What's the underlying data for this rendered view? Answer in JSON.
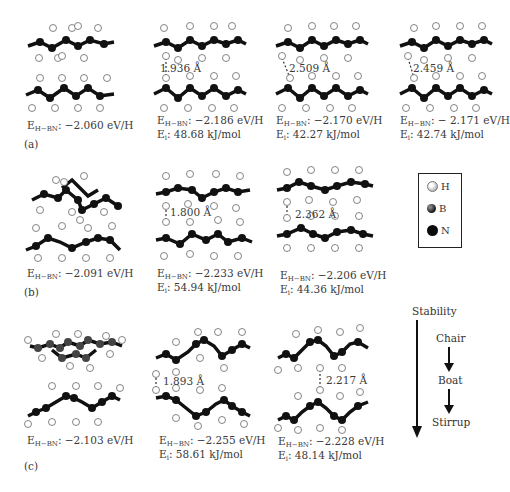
{
  "figure": {
    "rows": [
      {
        "label": "(a)",
        "panels": [
          {
            "energy_prefix": "E",
            "energy_sub": "H−BN",
            "energy_value": ": −2.060 eV/H",
            "ei_text": null,
            "distance": null
          },
          {
            "energy_prefix": "E",
            "energy_sub": "H−BN",
            "energy_value": ": −2.186 eV/H",
            "ei_prefix": "E",
            "ei_sub": "i",
            "ei_value": ": 48.68 kJ/mol",
            "distance": "1.936 Å"
          },
          {
            "energy_prefix": "E",
            "energy_sub": "H−BN",
            "energy_value": ": −2.170 eV/H",
            "ei_prefix": "E",
            "ei_sub": "i",
            "ei_value": ": 42.27 kJ/mol",
            "distance": "2.509 Å"
          },
          {
            "energy_prefix": "E",
            "energy_sub": "H−BN",
            "energy_value": ": − 2.171 eV/H",
            "ei_prefix": "E",
            "ei_sub": "i",
            "ei_value": ": 42.74 kJ/mol",
            "distance": "2.459 Å"
          }
        ]
      },
      {
        "label": "(b)",
        "panels": [
          {
            "energy_prefix": "E",
            "energy_sub": "H−BN",
            "energy_value": ": −2.091 eV/H",
            "distance": null
          },
          {
            "energy_prefix": "E",
            "energy_sub": "H−BN",
            "energy_value": ": −2.233 eV/H",
            "ei_prefix": "E",
            "ei_sub": "i",
            "ei_value": ": 54.94 kJ/mol",
            "distance": "1.800 Å"
          },
          {
            "energy_prefix": "E",
            "energy_sub": "H−BN",
            "energy_value": ": −2.206 eV/H",
            "ei_prefix": "E",
            "ei_sub": "i",
            "ei_value": ": 44.36 kJ/mol",
            "distance": "2.362 Å"
          }
        ]
      },
      {
        "label": "(c)",
        "panels": [
          {
            "energy_prefix": "E",
            "energy_sub": "H−BN",
            "energy_value": ": −2.103 eV/H",
            "distance": null
          },
          {
            "energy_prefix": "E",
            "energy_sub": "H−BN",
            "energy_value": ": −2.255 eV/H",
            "ei_prefix": "E",
            "ei_sub": "i",
            "ei_value": ": 58.61 kJ/mol",
            "distance": "1.893 Å"
          },
          {
            "energy_prefix": "E",
            "energy_sub": "H−BN",
            "energy_value": ": −2.228 eV/H",
            "ei_prefix": "E",
            "ei_sub": "i",
            "ei_value": ": 48.14 kJ/mol",
            "distance": "2.217 Å"
          }
        ]
      }
    ],
    "legend": {
      "items": [
        {
          "symbol": "H",
          "icon": "hydrogen-atom-icon",
          "color": "#e8e8e8"
        },
        {
          "symbol": "B",
          "icon": "boron-atom-icon",
          "color": "#444444"
        },
        {
          "symbol": "N",
          "icon": "nitrogen-atom-icon",
          "color": "#0a0a0a"
        }
      ]
    },
    "stability": {
      "title": "Stability",
      "order": [
        "Chair",
        "Boat",
        "Stirrup"
      ]
    }
  }
}
